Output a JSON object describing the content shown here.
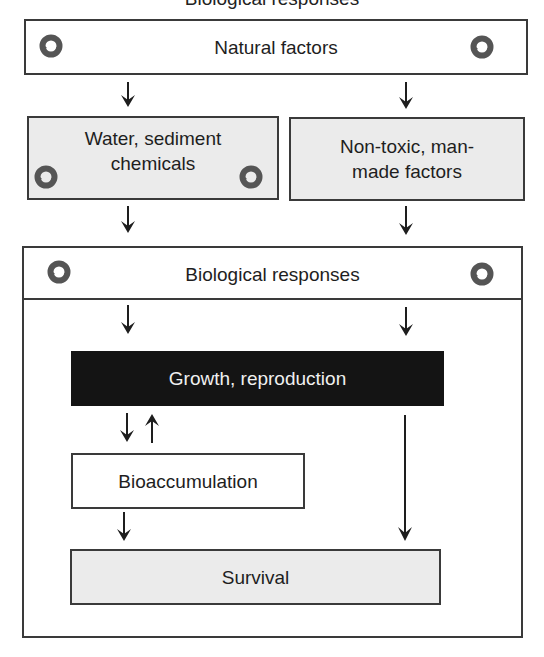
{
  "caption": "Biological responses",
  "nodes": {
    "natural_factors": "Natural factors",
    "water_sediment": "Water, sediment\nchemicals",
    "water_sediment_line1": "Water, sediment",
    "water_sediment_line2": "chemicals",
    "non_toxic_line1": "Non-toxic, man-",
    "non_toxic_line2": "made factors",
    "biological_responses": "Biological responses",
    "growth_reproduction": "Growth, reproduction",
    "bioaccumulation": "Bioaccumulation",
    "survival": "Survival"
  },
  "icons": {
    "cycle": "recycle-cycle-icon",
    "arrow": "down-arrow-icon"
  },
  "colors": {
    "border": "#3a3a3a",
    "gray_fill": "#ebebeb",
    "dark_fill": "#141414",
    "icon": "#555555"
  },
  "edges": [
    {
      "from": "Natural factors",
      "to": "Water, sediment chemicals"
    },
    {
      "from": "Natural factors",
      "to": "Non-toxic, man-made factors"
    },
    {
      "from": "Water, sediment chemicals",
      "to": "Biological responses"
    },
    {
      "from": "Non-toxic, man-made factors",
      "to": "Biological responses"
    },
    {
      "from": "Biological responses",
      "to": "Growth, reproduction"
    },
    {
      "from": "Growth, reproduction",
      "to": "Bioaccumulation"
    },
    {
      "from": "Bioaccumulation",
      "to": "Growth, reproduction"
    },
    {
      "from": "Bioaccumulation",
      "to": "Survival"
    },
    {
      "from": "Biological responses",
      "to": "Survival"
    }
  ]
}
